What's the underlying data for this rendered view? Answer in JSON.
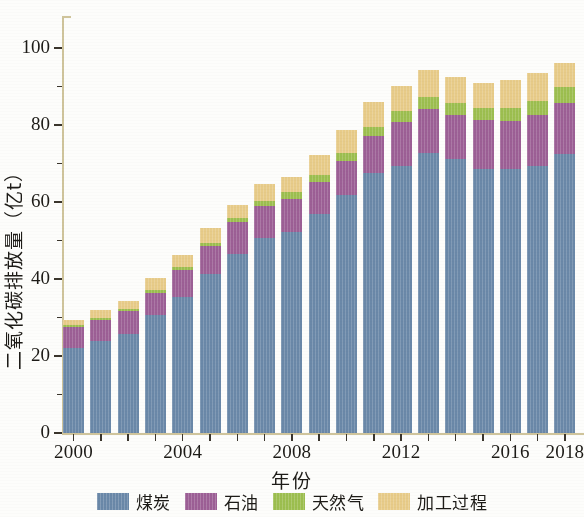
{
  "chart_data": {
    "type": "bar",
    "stacked": true,
    "title": "",
    "xlabel": "年份",
    "ylabel": "二氧化碳排放量（亿t）",
    "ylim": [
      0,
      105
    ],
    "yticks": [
      0,
      20,
      40,
      60,
      80,
      100
    ],
    "ytick_labels": [
      "0",
      "20",
      "40",
      "60",
      "80",
      "100"
    ],
    "xtick_labels": [
      "2000",
      "2004",
      "2008",
      "2012",
      "2016",
      "2018"
    ],
    "grid": false,
    "legend_position": "bottom",
    "categories": [
      "2000",
      "2001",
      "2002",
      "2003",
      "2004",
      "2005",
      "2006",
      "2007",
      "2008",
      "2009",
      "2010",
      "2011",
      "2012",
      "2013",
      "2014",
      "2015",
      "2016",
      "2017",
      "2018"
    ],
    "series": [
      {
        "name": "煤炭",
        "color": "#6a88a8",
        "values": [
          22.0,
          24.0,
          25.8,
          30.6,
          35.4,
          41.4,
          46.4,
          50.6,
          52.2,
          57.0,
          61.8,
          67.6,
          69.4,
          72.8,
          71.2,
          68.6,
          68.6,
          69.4,
          72.6
        ]
      },
      {
        "name": "石油",
        "color": "#9c5f95",
        "values": [
          5.6,
          5.4,
          5.8,
          5.9,
          6.9,
          7.1,
          8.4,
          8.4,
          8.6,
          8.3,
          8.8,
          9.6,
          11.4,
          11.4,
          11.4,
          12.6,
          12.4,
          13.2,
          13.0
        ]
      },
      {
        "name": "天然气",
        "color": "#9cbe4f",
        "values": [
          0.4,
          0.5,
          0.5,
          0.6,
          0.8,
          0.9,
          1.1,
          1.4,
          1.7,
          1.8,
          2.2,
          2.4,
          2.8,
          3.0,
          3.2,
          3.2,
          3.4,
          3.6,
          4.2
        ]
      },
      {
        "name": "加工过程",
        "color": "#e7cb88",
        "values": [
          1.4,
          2.1,
          2.3,
          3.1,
          3.1,
          3.8,
          3.4,
          4.4,
          4.1,
          5.0,
          6.0,
          6.5,
          6.6,
          7.2,
          6.8,
          6.6,
          7.2,
          7.2,
          6.4
        ]
      }
    ],
    "totals": [
      29.4,
      32.0,
      34.4,
      40.2,
      46.2,
      53.2,
      59.3,
      64.8,
      66.6,
      72.1,
      78.8,
      86.1,
      90.2,
      94.4,
      92.6,
      91.0,
      91.6,
      93.4,
      96.2
    ]
  },
  "legend": {
    "items": [
      {
        "label": "煤炭",
        "color": "#6a88a8"
      },
      {
        "label": "石油",
        "color": "#9c5f95"
      },
      {
        "label": "天然气",
        "color": "#9cbe4f"
      },
      {
        "label": "加工过程",
        "color": "#e7cb88"
      }
    ]
  }
}
